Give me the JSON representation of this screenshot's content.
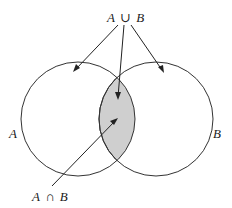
{
  "diagram": {
    "type": "venn",
    "sets": [
      {
        "id": "A",
        "label": "A"
      },
      {
        "id": "B",
        "label": "B"
      }
    ],
    "union_label": {
      "left": "A",
      "op": "∪",
      "right": "B"
    },
    "intersection_label": {
      "left": "A",
      "op": "∩",
      "right": "B"
    },
    "colors": {
      "intersection_fill": "#cfcfcf",
      "stroke": "#333333",
      "background": "#ffffff"
    },
    "annotations": [
      {
        "from": "union_label",
        "to": "set_A_only"
      },
      {
        "from": "union_label",
        "to": "intersection"
      },
      {
        "from": "union_label",
        "to": "set_B_only"
      },
      {
        "from": "intersection_label",
        "to": "intersection"
      }
    ]
  }
}
